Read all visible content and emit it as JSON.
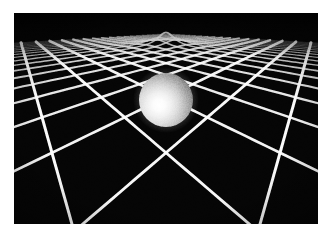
{
  "figure": {
    "alt_description": "A white rectangular grid drawn in perspective on a black background, bent downward into a funnel-shaped gravity well by a glowing white sphere resting at its center.",
    "background_color": "#ffffff",
    "scene_background_color": "#050505",
    "grid_color": "#ffffff",
    "sphere_highlight_color": "#fdfdfd",
    "sphere_midtone_color": "#d8d8d8",
    "sphere_shadow_color": "#6e6e6e",
    "sphere_rim_color": "#4a4a4a"
  },
  "layout": {
    "canvas_width": 333,
    "canvas_height": 241,
    "scene_left": 14,
    "scene_top": 13,
    "scene_width": 304,
    "scene_height": 211
  },
  "scene": {
    "label": "spacetime-curvature-visualization",
    "camera": {
      "horizon_y": 0.055,
      "eye_height": 1.0,
      "focal_length": 1.05,
      "tilt_label": "low oblique"
    },
    "sphere": {
      "center_x": 166,
      "center_y": 100,
      "radius": 27,
      "highlight_offset_x": -7,
      "highlight_offset_y": 5,
      "label": "massive-body"
    },
    "well": {
      "center_u": 0.0,
      "center_v": 0.0,
      "depth": 0.62,
      "width": 0.52,
      "label": "gravity-well"
    },
    "grid": {
      "lines_u": 21,
      "lines_v": 21,
      "extent": 5.0,
      "rotation_deg": 45,
      "stroke_min": 0.45,
      "stroke_max": 3.1
    }
  },
  "chart_data": {
    "type": "surface",
    "xlabel": "space (x)",
    "ylabel": "space (y)",
    "zlabel": "gravitational potential (depth)",
    "surface_model": "z = -depth / (1 + (r/width)^2)",
    "parameters": {
      "depth": 0.62,
      "width": 0.52,
      "center": [
        0.0,
        0.0
      ]
    },
    "grid_lines": 21,
    "grid_extent": [
      -5.0,
      5.0
    ],
    "legend": [],
    "annotations": []
  }
}
